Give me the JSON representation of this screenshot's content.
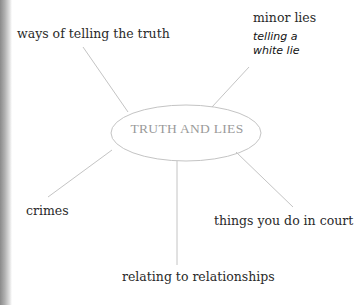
{
  "diagram": {
    "center": "TRUTH AND LIES",
    "branches": [
      {
        "label": "ways of telling the truth"
      },
      {
        "label": "minor lies",
        "handwritten": [
          "telling a",
          "white lie"
        ]
      },
      {
        "label": "crimes"
      },
      {
        "label": "things you do in court"
      },
      {
        "label": "relating to relationships"
      }
    ]
  },
  "colors": {
    "line": "#bdbdbd",
    "center_text": "#9a9a9a",
    "text": "#2a2a2a"
  }
}
